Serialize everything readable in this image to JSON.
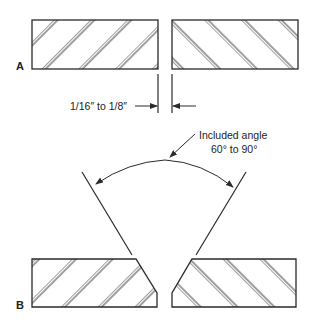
{
  "figure": {
    "labels": {
      "part_a": "A",
      "part_b": "B"
    },
    "annotations": {
      "gap_dimension": "1/16″ to 1/8″",
      "angle_title": "Included angle",
      "angle_range": "60° to 90°"
    },
    "colors": {
      "stroke": "#2a2a2a",
      "background": "#ffffff"
    }
  }
}
